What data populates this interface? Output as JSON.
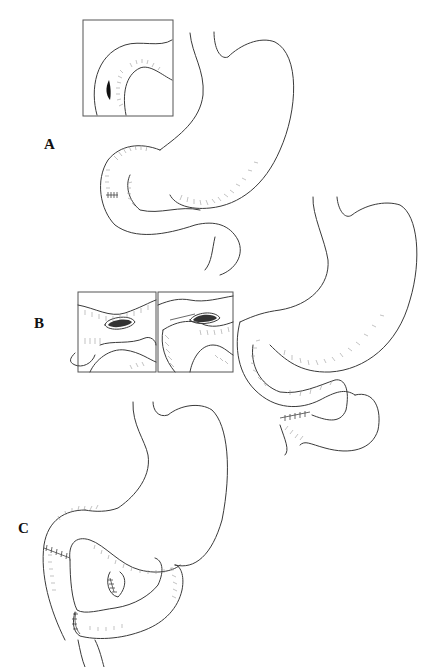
{
  "figure": {
    "panels": [
      {
        "label": "A",
        "description": "Stomach with gastrojejunal loop; inset showing small defect/perforation in bowel wall"
      },
      {
        "label": "B",
        "description": "Stomach with gastrojejunostomy; two insets showing open lumen and closure of defect"
      },
      {
        "label": "C",
        "description": "Stomach with anastomoses and sutured bowel ends"
      }
    ],
    "caption_visible": "FIGURE ... (caption cut off at bottom edge)"
  },
  "colors": {
    "line": "#3a3a3a",
    "hatch": "#9a9a9a",
    "background": "#ffffff"
  }
}
